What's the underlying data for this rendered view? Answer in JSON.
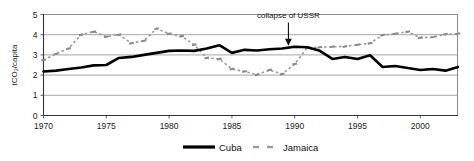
{
  "chart_data": {
    "type": "line",
    "title": "",
    "xlabel": "",
    "ylabel": "tCO₂/capita",
    "xlim": [
      1970,
      2003
    ],
    "ylim": [
      0,
      5
    ],
    "yticks": [
      0,
      1,
      2,
      3,
      4,
      5
    ],
    "xticks": [
      1970,
      1975,
      1980,
      1985,
      1990,
      1995,
      2000
    ],
    "grid": true,
    "legend_position": "bottom",
    "x": [
      1970,
      1971,
      1972,
      1973,
      1974,
      1975,
      1976,
      1977,
      1978,
      1979,
      1980,
      1981,
      1982,
      1983,
      1984,
      1985,
      1986,
      1987,
      1988,
      1989,
      1990,
      1991,
      1992,
      1993,
      1994,
      1995,
      1996,
      1997,
      1998,
      1999,
      2000,
      2001,
      2002,
      2003
    ],
    "series": [
      {
        "name": "Cuba",
        "color": "#000000",
        "style": "solid-thick",
        "values": [
          2.18,
          2.22,
          2.3,
          2.38,
          2.48,
          2.5,
          2.85,
          2.9,
          3.0,
          3.1,
          3.2,
          3.22,
          3.2,
          3.32,
          3.48,
          3.1,
          3.25,
          3.22,
          3.28,
          3.32,
          3.4,
          3.38,
          3.2,
          2.8,
          2.9,
          2.8,
          2.98,
          2.4,
          2.45,
          2.35,
          2.25,
          2.3,
          2.22,
          2.4
        ]
      },
      {
        "name": "Jamaica",
        "color": "#9a9a9a",
        "style": "dashed-marker",
        "values": [
          2.75,
          3.05,
          3.32,
          4.0,
          4.15,
          3.9,
          4.0,
          3.58,
          3.7,
          4.3,
          4.05,
          3.92,
          3.5,
          2.85,
          2.8,
          2.3,
          2.18,
          2.02,
          2.25,
          2.05,
          2.55,
          3.35,
          3.38,
          3.4,
          3.42,
          3.5,
          3.58,
          3.98,
          4.05,
          4.15,
          3.85,
          3.88,
          4.02,
          4.05
        ]
      }
    ],
    "annotations": [
      {
        "text": "collapse of USSR",
        "x": 1989.5,
        "y_text": 4.95,
        "arrow_to_y": 3.4
      }
    ]
  },
  "legend": {
    "items": [
      {
        "label": "Cuba"
      },
      {
        "label": "Jamaica"
      }
    ]
  },
  "axes": {
    "y_title": "tCO₂/capita",
    "y_tick_labels": [
      "5",
      "4",
      "3",
      "2",
      "1",
      "0"
    ],
    "x_tick_labels": [
      "1970",
      "1975",
      "1980",
      "1985",
      "1990",
      "1995",
      "2000"
    ]
  },
  "icons": {
    "arrow": "down-arrow-icon"
  }
}
